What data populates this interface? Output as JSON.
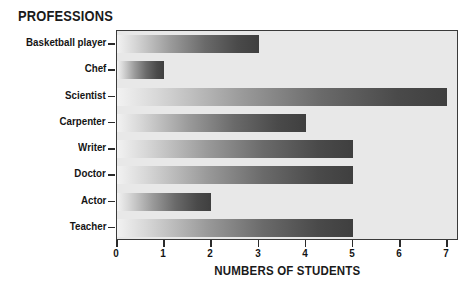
{
  "chart_data": {
    "type": "bar",
    "orientation": "horizontal",
    "title": "PROFESSIONS",
    "xlabel": "NUMBERS OF STUDENTS",
    "ylabel": "PROFESSIONS",
    "categories": [
      "Basketball player",
      "Chef",
      "Scientist",
      "Carpenter",
      "Writer",
      "Doctor",
      "Actor",
      "Teacher"
    ],
    "values": [
      3,
      1,
      7,
      4,
      5,
      5,
      2,
      5
    ],
    "xlim": [
      0,
      7.25
    ],
    "xticks": [
      0,
      1,
      2,
      3,
      4,
      5,
      6,
      7
    ],
    "xticklabels": [
      "0",
      "1",
      "2",
      "3",
      "4",
      "5",
      "6",
      "7"
    ],
    "grid": false,
    "legend": false,
    "bar_style": "grayscale-gradient-left-light-to-right-dark",
    "plot_background": "#e8e8e8",
    "frame_color": "#3a3a3a",
    "text_color": "#141414"
  }
}
